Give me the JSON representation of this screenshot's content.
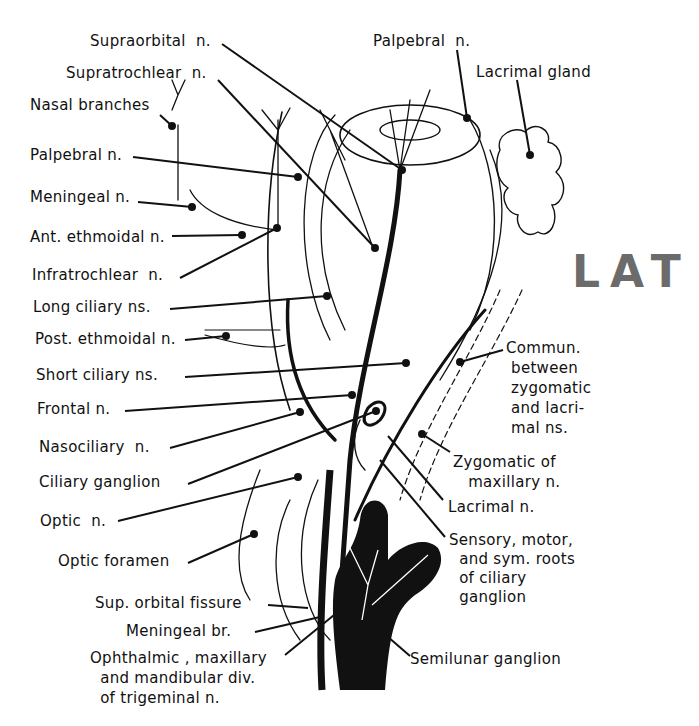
{
  "figure": {
    "annotation": {
      "text": "LAT",
      "color": "#6b6b6b"
    },
    "ink_color": "#111111",
    "background": "#ffffff"
  },
  "labels": {
    "left": [
      {
        "id": "supraorbital",
        "text": "Supraorbital  n."
      },
      {
        "id": "supratrochlear",
        "text": "Supratrochlear  n."
      },
      {
        "id": "nasal_branches",
        "text": "Nasal branches"
      },
      {
        "id": "palpebral_left",
        "text": "Palpebral n."
      },
      {
        "id": "meningeal",
        "text": "Meningeal n."
      },
      {
        "id": "ant_ethmoidal",
        "text": "Ant. ethmoidal n."
      },
      {
        "id": "infratrochlear",
        "text": "Infratrochlear  n."
      },
      {
        "id": "long_ciliary",
        "text": "Long ciliary ns."
      },
      {
        "id": "post_ethmoidal",
        "text": "Post. ethmoidal n."
      },
      {
        "id": "short_ciliary",
        "text": "Short ciliary ns."
      },
      {
        "id": "frontal",
        "text": "Frontal n."
      },
      {
        "id": "nasociliary",
        "text": "Nasociliary  n."
      },
      {
        "id": "ciliary_ganglion",
        "text": "Ciliary ganglion"
      },
      {
        "id": "optic_n",
        "text": "Optic  n."
      },
      {
        "id": "optic_foramen",
        "text": "Optic foramen"
      },
      {
        "id": "sup_orbital_fissure",
        "text": "Sup. orbital fissure"
      },
      {
        "id": "meningeal_br",
        "text": "Meningeal br."
      },
      {
        "id": "trigeminal_divs",
        "text": "Ophthalmic , maxillary\n  and mandibular div.\n  of trigeminal n."
      }
    ],
    "right": [
      {
        "id": "palpebral_right",
        "text": "Palpebral  n."
      },
      {
        "id": "lacrimal_gland",
        "text": "Lacrimal gland"
      },
      {
        "id": "commun",
        "text": "Commun.\n between\n zygomatic\n and lacri-\n mal ns."
      },
      {
        "id": "zygomatic_maxillary",
        "text": "Zygomatic of\n   maxillary n."
      },
      {
        "id": "lacrimal_n",
        "text": "Lacrimal n."
      },
      {
        "id": "roots_ciliary",
        "text": "Sensory, motor,\n  and sym. roots\n  of ciliary\n  ganglion"
      },
      {
        "id": "semilunar",
        "text": "Semilunar ganglion"
      }
    ]
  }
}
